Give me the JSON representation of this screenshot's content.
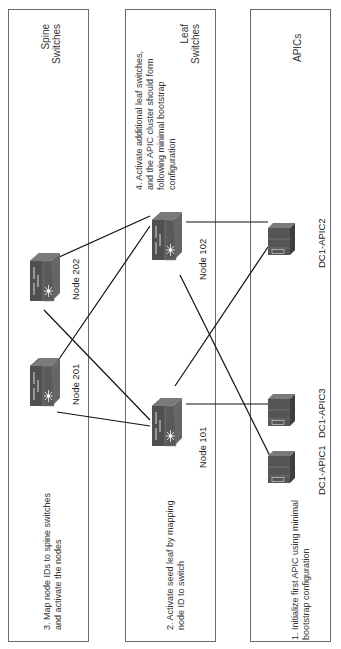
{
  "panels": {
    "spine": {
      "title_line1": "Spine",
      "title_line2": "Switches",
      "step_line1": "3. Map node IDs to spine switches",
      "step_line2": "and activate the nodes"
    },
    "leaf": {
      "title_line1": "Leaf",
      "title_line2": "Switches",
      "step2_line1": "2. Activate seed leaf by mapping",
      "step2_line2": "node ID to switch",
      "step4_line1": "4. Activate additional leaf switches,",
      "step4_line2": "and the APIC cluster should form",
      "step4_line3": "following minimal bootstrap",
      "step4_line4": "configuration"
    },
    "apic": {
      "title": "APICs",
      "step_line1": "1. Initialize first APIC using minimal",
      "step_line2": "bootstrap configuration"
    }
  },
  "nodes": {
    "spine_202": {
      "label": "Node 202",
      "icon": "nexus-switch-icon"
    },
    "spine_201": {
      "label": "Node 201",
      "icon": "nexus-switch-icon"
    },
    "leaf_102": {
      "label": "Node 102",
      "icon": "nexus-switch-icon"
    },
    "leaf_101": {
      "label": "Node 101",
      "icon": "nexus-switch-icon"
    },
    "apic2": {
      "label": "DC1-APIC2",
      "icon": "server-icon"
    },
    "apic3": {
      "label": "DC1-APIC3",
      "icon": "server-icon"
    },
    "apic1": {
      "label": "DC1-APIC1",
      "icon": "server-icon"
    }
  },
  "links": [
    [
      "spine_202",
      "leaf_102"
    ],
    [
      "spine_202",
      "leaf_101"
    ],
    [
      "spine_201",
      "leaf_102"
    ],
    [
      "spine_201",
      "leaf_101"
    ],
    [
      "leaf_102",
      "apic2"
    ],
    [
      "leaf_102",
      "apic1"
    ],
    [
      "leaf_101",
      "apic2"
    ],
    [
      "leaf_101",
      "apic3"
    ]
  ],
  "colors": {
    "device_dark": "#4a4a4a",
    "device_mid": "#5c5c5c",
    "device_light": "#707070",
    "line": "#111111",
    "border": "#6a6a6a"
  },
  "caption": "Figure 2-... ACI fabric initialization"
}
